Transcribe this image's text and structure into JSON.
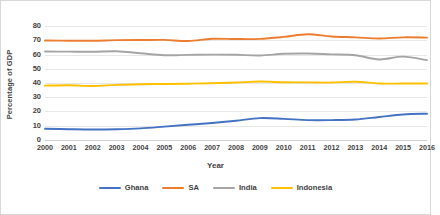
{
  "chart_data": {
    "type": "line",
    "title": "",
    "xlabel": "Year",
    "ylabel": "Percentage of GDP",
    "xlim": [
      2000,
      2016
    ],
    "ylim": [
      0,
      80
    ],
    "ytick_step": 10,
    "yticks": [
      80,
      70,
      60,
      50,
      40,
      30,
      20,
      10,
      0
    ],
    "grid": true,
    "legend_position": "bottom",
    "categories": [
      2000,
      2001,
      2002,
      2003,
      2004,
      2005,
      2006,
      2007,
      2008,
      2009,
      2010,
      2011,
      2012,
      2013,
      2014,
      2015,
      2016
    ],
    "xticks": [
      "2000",
      "2001",
      "2002",
      "2003",
      "2004",
      "2005",
      "2006",
      "2007",
      "2008",
      "2009",
      "2010",
      "2011",
      "2012",
      "2013",
      "2014",
      "2015",
      "2016"
    ],
    "series": [
      {
        "name": "Ghana",
        "color": "#4472C4",
        "values": [
          7.5,
          7.2,
          7.0,
          7.2,
          7.8,
          9.0,
          10.3,
          11.6,
          13.2,
          15.0,
          14.5,
          13.6,
          13.6,
          14.0,
          15.8,
          17.6,
          18.1
        ]
      },
      {
        "name": "SA",
        "color": "#ED7D31",
        "values": [
          69.8,
          69.6,
          69.6,
          70.0,
          70.1,
          70.2,
          69.4,
          71.0,
          70.8,
          70.9,
          72.3,
          74.2,
          72.6,
          72.0,
          71.2,
          72.0,
          71.8
        ]
      },
      {
        "name": "India",
        "color": "#A5A5A5",
        "values": [
          62.0,
          61.9,
          61.8,
          62.2,
          60.8,
          59.4,
          59.6,
          59.8,
          59.7,
          59.2,
          60.4,
          60.6,
          60.0,
          59.4,
          56.4,
          58.4,
          55.9
        ]
      },
      {
        "name": "Indonesia",
        "color": "#FFC000",
        "values": [
          37.9,
          38.2,
          37.7,
          38.5,
          38.9,
          39.1,
          39.3,
          39.6,
          40.1,
          40.8,
          40.3,
          40.2,
          40.1,
          40.7,
          39.4,
          39.4,
          39.4
        ]
      }
    ]
  }
}
